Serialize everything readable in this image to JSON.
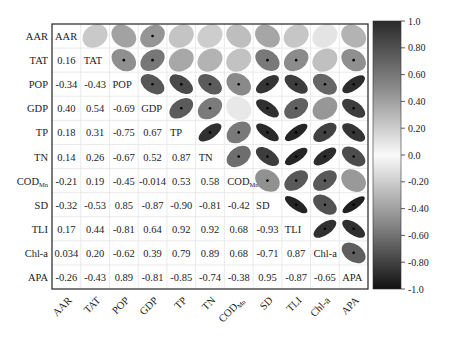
{
  "chart_data": {
    "type": "heatmap",
    "subtype": "correlation-matrix-ellipse",
    "title": "",
    "variables": [
      "AAR",
      "TAT",
      "POP",
      "GDP",
      "TP",
      "TN",
      "COD_Mn",
      "SD",
      "TLI",
      "Chl-a",
      "APA"
    ],
    "variable_display": [
      "AAR",
      "TAT",
      "POP",
      "GDP",
      "TP",
      "TN",
      "COD",
      "SD",
      "TLI",
      "Chl-a",
      "APA"
    ],
    "variable_subscripts": [
      "",
      "",
      "",
      "",
      "",
      "",
      "Mn",
      "",
      "",
      "",
      ""
    ],
    "lower_triangle_values": [
      [],
      [
        0.16
      ],
      [
        -0.34,
        -0.43
      ],
      [
        0.4,
        0.54,
        -0.69
      ],
      [
        0.18,
        0.31,
        -0.75,
        0.67
      ],
      [
        0.14,
        0.26,
        -0.67,
        0.52,
        0.87
      ],
      [
        -0.21,
        0.19,
        -0.45,
        -0.014,
        0.53,
        0.58
      ],
      [
        -0.32,
        -0.53,
        0.85,
        -0.87,
        -0.9,
        -0.81,
        -0.42
      ],
      [
        0.17,
        0.44,
        -0.81,
        0.64,
        0.92,
        0.92,
        0.68,
        -0.93
      ],
      [
        0.034,
        0.2,
        -0.62,
        0.39,
        0.79,
        0.89,
        0.68,
        -0.71,
        0.87
      ],
      [
        -0.26,
        -0.43,
        0.89,
        -0.81,
        -0.85,
        -0.74,
        -0.38,
        0.95,
        -0.87,
        -0.65
      ]
    ],
    "lower_triangle_labels": [
      [],
      [
        "0.16"
      ],
      [
        "-0.34",
        "-0.43"
      ],
      [
        "0.40",
        "0.54",
        "-0.69"
      ],
      [
        "0.18",
        "0.31",
        "-0.75",
        "0.67"
      ],
      [
        "0.14",
        "0.26",
        "-0.67",
        "0.52",
        "0.87"
      ],
      [
        "-0.21",
        "0.19",
        "-0.45",
        "-0.014",
        "0.53",
        "0.58"
      ],
      [
        "-0.32",
        "-0.53",
        "0.85",
        "-0.87",
        "-0.90",
        "-0.81",
        "-0.42"
      ],
      [
        "0.17",
        "0.44",
        "-0.81",
        "0.64",
        "0.92",
        "0.92",
        "0.68",
        "-0.93"
      ],
      [
        "0.034",
        "0.20",
        "-0.62",
        "0.39",
        "0.79",
        "0.89",
        "0.68",
        "-0.71",
        "0.87"
      ],
      [
        "-0.26",
        "-0.43",
        "0.89",
        "-0.81",
        "-0.85",
        "-0.74",
        "-0.38",
        "0.95",
        "-0.87",
        "-0.65"
      ]
    ],
    "upper_triangle": "ellipses (shape and grey shade encode correlation; significance marked with dot)",
    "colorbar": {
      "min": -1.0,
      "max": 1.0,
      "ticks": [
        "1.0",
        "0.80",
        "0.60",
        "0.40",
        "0.20",
        "0.0",
        "-0.20",
        "-0.40",
        "-0.60",
        "-0.80",
        "-1.0"
      ],
      "colormap": "grey diverging (dark at ±1, white at 0)"
    },
    "xlabel": "",
    "ylabel": "",
    "grid": true,
    "legend_position": "right (colorbar)"
  }
}
